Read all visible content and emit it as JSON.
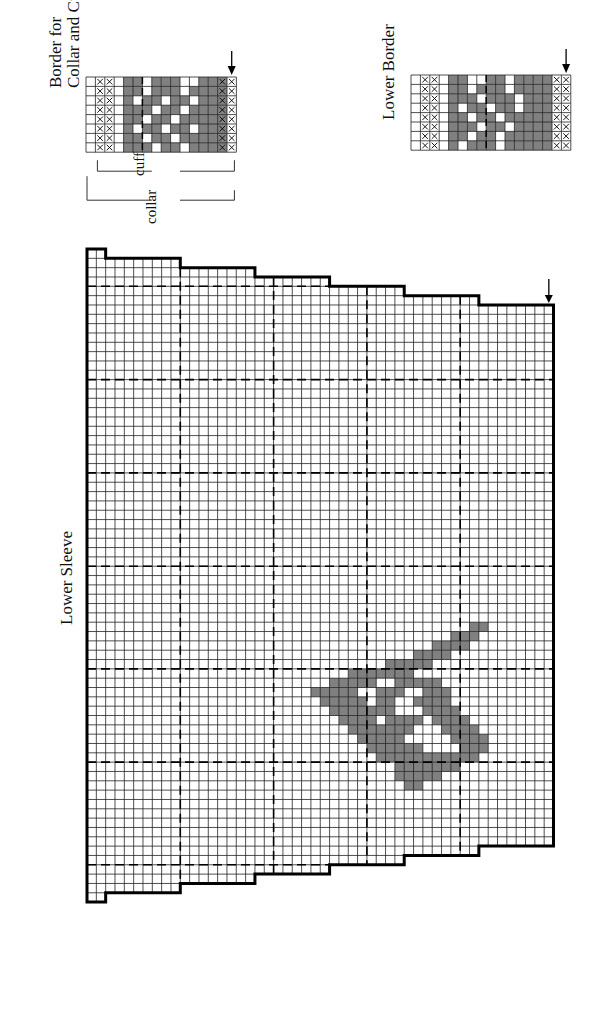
{
  "labels": {
    "border_title_line1": "Border for",
    "border_title_line2": "Collar and Cuffs",
    "cuff": "cuff",
    "collar": "collar",
    "lower_border": "Lower Border",
    "lower_sleeve": "Lower Sleeve"
  },
  "colors": {
    "fill": "#808080",
    "grid": "#222222",
    "outline": "#000000"
  },
  "main_chart": {
    "origin_x": 87,
    "origin_y": 249,
    "cell": 9.33,
    "cols": 50,
    "rows": 70,
    "step_every_cols": 8,
    "dashed_cols": [
      10,
      20,
      30,
      40
    ],
    "dashed_rows": [
      4,
      14,
      24,
      34,
      45,
      55,
      66
    ],
    "arrow_col": 49,
    "motif_spans": [
      [
        40,
        41,
        42
      ],
      [
        41,
        39,
        41
      ],
      [
        42,
        37,
        40
      ],
      [
        43,
        35,
        38
      ],
      [
        44,
        32,
        36
      ],
      [
        45,
        28,
        34
      ],
      [
        46,
        26,
        30
      ],
      [
        46,
        33,
        37
      ],
      [
        47,
        24,
        28
      ],
      [
        47,
        31,
        33
      ],
      [
        47,
        36,
        38
      ],
      [
        48,
        25,
        29
      ],
      [
        48,
        31,
        32
      ],
      [
        48,
        35,
        38
      ],
      [
        49,
        26,
        30
      ],
      [
        49,
        31,
        32
      ],
      [
        49,
        36,
        39
      ],
      [
        50,
        27,
        30
      ],
      [
        50,
        32,
        35
      ],
      [
        50,
        37,
        40
      ],
      [
        51,
        28,
        32
      ],
      [
        51,
        33,
        34
      ],
      [
        51,
        38,
        41
      ],
      [
        52,
        29,
        33
      ],
      [
        52,
        39,
        42
      ],
      [
        53,
        30,
        35
      ],
      [
        53,
        40,
        42
      ],
      [
        54,
        31,
        36
      ],
      [
        54,
        37,
        41
      ],
      [
        55,
        33,
        39
      ],
      [
        56,
        33,
        37
      ],
      [
        57,
        34,
        35
      ]
    ]
  },
  "border_chart": {
    "x": 86,
    "y": 77,
    "cell": 9.4,
    "cols": 16,
    "rows": 8,
    "x_cols": [
      1,
      2,
      14,
      15
    ],
    "fill": [
      "0000110111001110",
      "0000110111011110",
      "0000101101101110",
      "0000111011011110",
      "0000110110111110",
      "0000101101101110",
      "0000110110111110",
      "0000111011011110"
    ],
    "dashed_col": 6
  },
  "lower_border_chart": {
    "x": 411,
    "y": 75,
    "cell": 9.4,
    "cols": 16,
    "rows": 8,
    "x_cols": [
      1,
      2,
      15,
      16
    ],
    "fill": [
      "0000110011011110",
      "0000110111011110",
      "0000111011101110",
      "0000101101101110",
      "0000110110111110",
      "0000111011011110",
      "0000110110111110",
      "0000101110111110"
    ],
    "dashed_col": 8
  }
}
